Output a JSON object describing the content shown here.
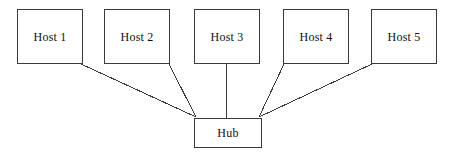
{
  "diagram": {
    "background_color": "#ffffff",
    "line_color": "#3a3a3a",
    "border_color": "#3a3a3a",
    "text_color": "#101010"
  },
  "hosts": [
    {
      "label": "Host 1",
      "x": 17,
      "y": 9,
      "w": 66,
      "h": 55
    },
    {
      "label": "Host 2",
      "x": 104,
      "y": 9,
      "w": 66,
      "h": 55
    },
    {
      "label": "Host 3",
      "x": 194,
      "y": 9,
      "w": 66,
      "h": 55
    },
    {
      "label": "Host 4",
      "x": 283,
      "y": 9,
      "w": 66,
      "h": 55
    },
    {
      "label": "Host 5",
      "x": 371,
      "y": 9,
      "w": 66,
      "h": 55
    }
  ],
  "hub": {
    "label": "Hub",
    "x": 194,
    "y": 118,
    "w": 68,
    "h": 30
  },
  "links": [
    {
      "from": "Host 1",
      "to": "Hub",
      "x1": 81,
      "y1": 64,
      "x2": 196,
      "y2": 117
    },
    {
      "from": "Host 2",
      "to": "Hub",
      "x1": 169,
      "y1": 64,
      "x2": 196,
      "y2": 117
    },
    {
      "from": "Host 3",
      "to": "Hub",
      "x1": 226,
      "y1": 64,
      "x2": 226,
      "y2": 118
    },
    {
      "from": "Host 4",
      "to": "Hub",
      "x1": 284,
      "y1": 64,
      "x2": 259,
      "y2": 117
    },
    {
      "from": "Host 5",
      "to": "Hub",
      "x1": 372,
      "y1": 64,
      "x2": 259,
      "y2": 117
    }
  ]
}
